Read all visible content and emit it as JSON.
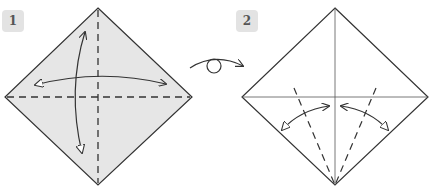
{
  "steps": [
    {
      "number": "1",
      "paper_fill": "#e6e6e6",
      "creases": [
        "vertical-dashed",
        "horizontal-dashed"
      ],
      "arrows": [
        "fold-and-unfold-horizontal",
        "fold-and-unfold-vertical"
      ]
    },
    {
      "number": "2",
      "paper_fill": "#ffffff",
      "creases": [
        "vertical-solid",
        "horizontal-solid",
        "left-dashed-to-bottom",
        "right-dashed-to-bottom"
      ],
      "arrows": [
        "fold-and-unfold-left-edge",
        "fold-and-unfold-right-edge"
      ]
    }
  ],
  "transition": {
    "symbol": "turn-over",
    "description": "Turn the paper over"
  },
  "colors": {
    "line": "#333333",
    "badge_bg": "#e3e3e3",
    "badge_text": "#555555"
  }
}
